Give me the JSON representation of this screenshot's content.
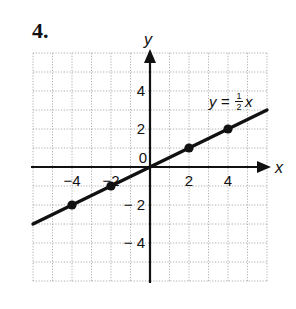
{
  "problem": {
    "number": "4."
  },
  "chart_data": {
    "type": "line",
    "title": "",
    "xlabel": "x",
    "ylabel": "y",
    "xlim": [
      -6,
      6
    ],
    "ylim": [
      -6,
      6
    ],
    "grid": true,
    "grid_style": "dotted",
    "x_ticks": [
      -4,
      -2,
      2,
      4
    ],
    "y_ticks": [
      4,
      2,
      -2,
      -4
    ],
    "origin_label": "0",
    "series": [
      {
        "name": "y = ½x",
        "equation": "y = 1/2 x",
        "slope": 0.5,
        "intercept": 0,
        "line_x_range": [
          -6,
          6
        ],
        "points": [
          {
            "x": -4,
            "y": -2
          },
          {
            "x": -2,
            "y": -1
          },
          {
            "x": 2,
            "y": 1
          },
          {
            "x": 4,
            "y": 2
          }
        ]
      }
    ],
    "annotation": {
      "text_left": "y = ",
      "frac_num": "1",
      "frac_den": "2",
      "text_right": "x"
    }
  }
}
